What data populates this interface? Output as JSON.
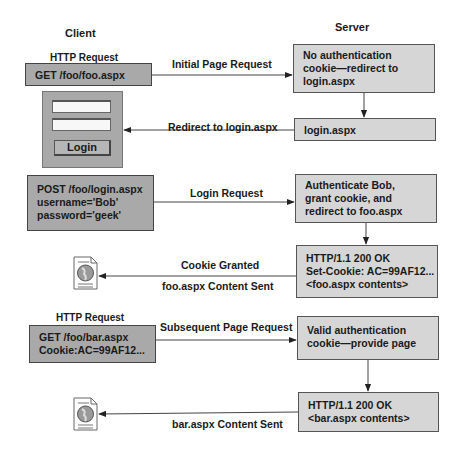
{
  "columns": {
    "client": "Client",
    "server": "Server"
  },
  "client": {
    "request1_title": "HTTP Request",
    "request1": "GET /foo/foo.aspx",
    "login_form": {
      "username_value": "",
      "password_value": "",
      "button_label": "Login"
    },
    "post_request": "POST /foo/login.aspx\nusername='Bob'\npassword='geek'",
    "request2_title": "HTTP Request",
    "request2": "GET /foo/bar.aspx\nCookie:AC=99AF12..."
  },
  "server": {
    "step1": "No authentication\ncookie—redirect to\nlogin.aspx",
    "step2": "login.aspx",
    "step3": "Authenticate Bob,\ngrant cookie, and\nredirect to foo.aspx",
    "step4": "HTTP/1.1 200 OK\nSet-Cookie: AC=99AF12...\n<foo.aspx contents>",
    "step5": "Valid authentication\ncookie—provide page",
    "step6": "HTTP/1.1 200 OK\n<bar.aspx contents>"
  },
  "arrows": {
    "initial_request": "Initial Page Request",
    "redirect": "Redirect to login.aspx",
    "login_request": "Login Request",
    "cookie_granted": "Cookie Granted",
    "foo_sent": "foo.aspx Content Sent",
    "subsequent_request": "Subsequent Page Request",
    "bar_sent": "bar.aspx Content Sent"
  },
  "colors": {
    "server_box": "#d6d6d6",
    "client_box": "#a9a9a9",
    "line": "#333333"
  }
}
